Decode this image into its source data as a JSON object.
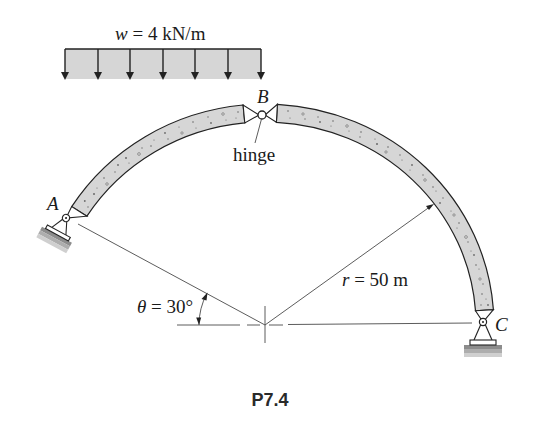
{
  "figure": {
    "caption": "P7.4"
  },
  "load": {
    "symbol": "w",
    "rest": " = 4 kN/m",
    "arrow_count": 7
  },
  "labels": {
    "A": "A",
    "B": "B",
    "C": "C",
    "hinge": "hinge"
  },
  "angle": {
    "symbol": "θ",
    "rest": " = 30°"
  },
  "radius": {
    "symbol": "r",
    "rest": " = 50 m"
  },
  "colors": {
    "concrete_fill": "#d6d6d6",
    "line": "#222222",
    "thin_line": "#4a4a4a",
    "ground": "#b4b4b4",
    "background": "#ffffff"
  }
}
